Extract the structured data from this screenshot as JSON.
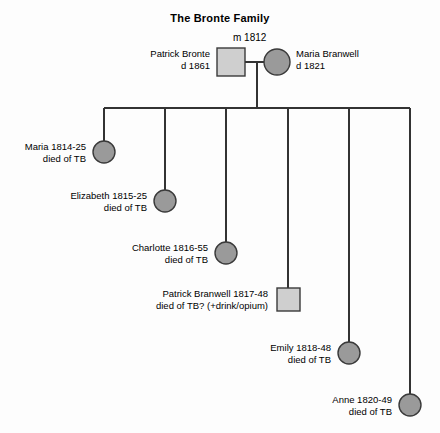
{
  "diagram": {
    "title": "The Bronte Family",
    "type": "family-tree",
    "background_color": "#fdfdfd",
    "line_color": "#333333",
    "female_fill": "#9a9a9a",
    "male_fill": "#cfcfcf",
    "node_border_color": "#3a3a3a"
  },
  "marriage": {
    "label": "m 1812"
  },
  "parents": {
    "father": {
      "name": "Patrick Bronte",
      "dates": "d  1861",
      "shape": "square",
      "sex": "male"
    },
    "mother": {
      "name": "Maria Branwell",
      "dates": "d  1821",
      "shape": "circle",
      "sex": "female"
    }
  },
  "children": [
    {
      "name": "Maria 1814-25",
      "cause": "died of TB",
      "shape": "circle",
      "sex": "female"
    },
    {
      "name": "Elizabeth 1815-25",
      "cause": "died of TB",
      "shape": "circle",
      "sex": "female"
    },
    {
      "name": "Charlotte 1816-55",
      "cause": "died of TB",
      "shape": "circle",
      "sex": "female"
    },
    {
      "name": "Patrick Branwell 1817-48",
      "cause": "died of TB? (+drink/opium)",
      "shape": "square",
      "sex": "male"
    },
    {
      "name": "Emily 1818-48",
      "cause": "died of TB",
      "shape": "circle",
      "sex": "female"
    },
    {
      "name": "Anne 1820-49",
      "cause": "died of TB",
      "shape": "circle",
      "sex": "female"
    }
  ]
}
